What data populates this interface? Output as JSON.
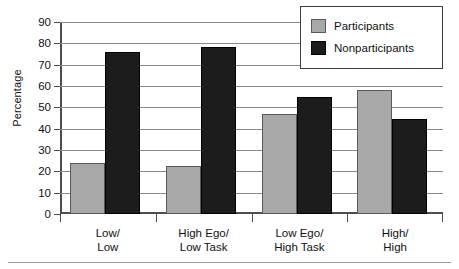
{
  "chart_data": {
    "type": "bar",
    "title": "",
    "subtitle": "",
    "xlabel": "",
    "ylabel": "Percentage",
    "ylim": [
      0,
      90
    ],
    "ytick_step": 10,
    "yticks": [
      0,
      10,
      20,
      30,
      40,
      50,
      60,
      70,
      80,
      90
    ],
    "grid": true,
    "legend_position": "top-right",
    "categories": [
      "Low/\nLow",
      "High Ego/\nLow Task",
      "Low Ego/\nHigh Task",
      "High/\nHigh"
    ],
    "category_lines": [
      {
        "line1": "Low/",
        "line2": "Low"
      },
      {
        "line1": "High Ego/",
        "line2": "Low Task"
      },
      {
        "line1": "Low Ego/",
        "line2": "High Task"
      },
      {
        "line1": "High/",
        "line2": "High"
      }
    ],
    "series": [
      {
        "name": "Participants",
        "color": "#a8a8a8",
        "values": [
          24,
          22.5,
          47,
          58
        ]
      },
      {
        "name": "Nonparticipants",
        "color": "#1c1c1c",
        "values": [
          76,
          78.5,
          55,
          44.5
        ]
      }
    ]
  },
  "legend": {
    "items": [
      {
        "label": "Participants",
        "swatch": "participants-swatch"
      },
      {
        "label": "Nonparticipants",
        "swatch": "nonparticipants-swatch"
      }
    ]
  },
  "axes": {
    "y_title": "Percentage",
    "y_tick_labels": [
      "90",
      "80",
      "70",
      "60",
      "50",
      "40",
      "30",
      "20",
      "10",
      "0"
    ]
  }
}
